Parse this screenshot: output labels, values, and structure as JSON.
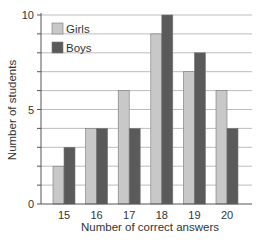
{
  "chart_data": {
    "type": "bar",
    "title": "",
    "xlabel": "Number of correct answers",
    "ylabel": "Number of students",
    "categories": [
      "15",
      "16",
      "17",
      "18",
      "19",
      "20"
    ],
    "series": [
      {
        "name": "Girls",
        "values": [
          2,
          4,
          6,
          9,
          7,
          6
        ],
        "color": "#c8c8c8"
      },
      {
        "name": "Boys",
        "values": [
          3,
          4,
          4,
          10,
          8,
          4
        ],
        "color": "#5a5a5a"
      }
    ],
    "ylim": [
      0,
      10
    ],
    "yticks": [
      0,
      5,
      10
    ],
    "grid": true,
    "legend_position": "top-left"
  }
}
